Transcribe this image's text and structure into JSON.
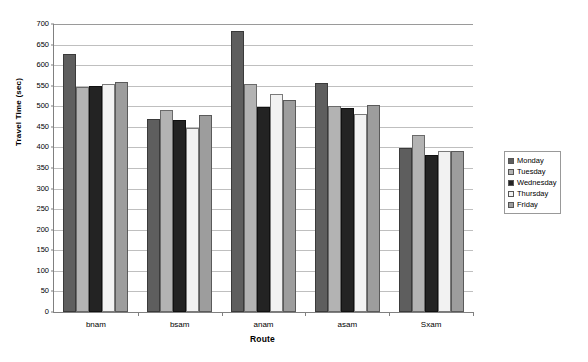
{
  "chart_data": {
    "type": "bar",
    "title": "",
    "xlabel": "Route",
    "ylabel": "Travel Time (sec)",
    "categories": [
      "bnam",
      "bsam",
      "anam",
      "asam",
      "Sxam"
    ],
    "ylim": [
      0,
      700
    ],
    "ytick_step": 50,
    "yticks": [
      0,
      50,
      100,
      150,
      200,
      250,
      300,
      350,
      400,
      450,
      500,
      550,
      600,
      650,
      700
    ],
    "ytick_labels": [
      "0",
      "50",
      "100",
      "150",
      "200",
      "250",
      "300",
      "350",
      "400",
      "450",
      "500",
      "550",
      "600",
      "650",
      "700"
    ],
    "grid": true,
    "legend_position": "right",
    "series": [
      {
        "name": "Monday",
        "color": "#5e5e5e",
        "values": [
          627,
          470,
          683,
          556,
          398
        ]
      },
      {
        "name": "Tuesday",
        "color": "#b3b3b3",
        "values": [
          548,
          492,
          553,
          500,
          430
        ]
      },
      {
        "name": "Wednesday",
        "color": "#232323",
        "values": [
          549,
          467,
          498,
          497,
          382
        ]
      },
      {
        "name": "Thursday",
        "color": "#f2f2f2",
        "values": [
          555,
          448,
          531,
          482,
          392
        ]
      },
      {
        "name": "Friday",
        "color": "#9d9d9d",
        "values": [
          560,
          478,
          515,
          504,
          392
        ]
      }
    ]
  },
  "axes": {
    "y_title": "Travel Time (sec)",
    "x_title": "Route"
  }
}
